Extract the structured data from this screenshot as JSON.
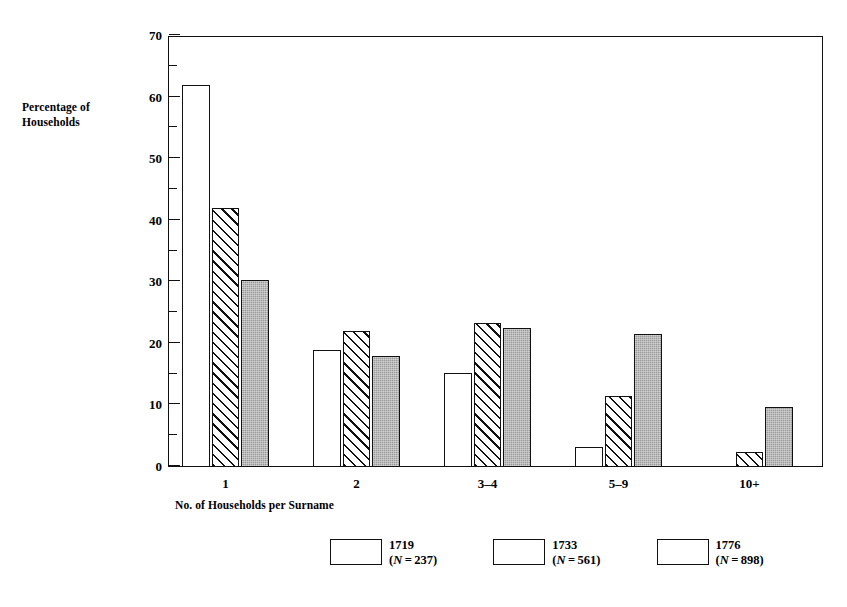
{
  "chart_data": {
    "type": "bar",
    "title": "",
    "xlabel": "No. of Households per Surname",
    "ylabel": "Percentage of Households",
    "categories": [
      "1",
      "2",
      "3–4",
      "5–9",
      "10+"
    ],
    "ylim": [
      0,
      70
    ],
    "y_ticks_major": [
      0,
      10,
      20,
      30,
      40,
      50,
      60,
      70
    ],
    "y_tick_labels": [
      "0",
      "10",
      "20",
      "30",
      "40",
      "50",
      "60",
      "70"
    ],
    "y_ticks_minor": [
      5,
      15,
      25,
      35,
      45,
      55,
      65
    ],
    "grid": false,
    "legend_position": "bottom-center",
    "series": [
      {
        "name": "1719",
        "n_label": "(N = 237)",
        "n_value": 237,
        "style": "open",
        "values": [
          62.0,
          19.0,
          15.3,
          3.2,
          0.0
        ]
      },
      {
        "name": "1733",
        "n_label": "(N = 561)",
        "n_value": 561,
        "style": "hatch",
        "values": [
          42.0,
          22.1,
          23.4,
          11.5,
          2.5
        ]
      },
      {
        "name": "1776",
        "n_label": "(N = 898)",
        "n_value": 898,
        "style": "solid",
        "values": [
          30.3,
          18.1,
          22.5,
          21.6,
          9.7
        ]
      }
    ]
  },
  "colors": {
    "axis": "#111111",
    "bar_open": "#ffffff",
    "bar_hatch": "#ffffff",
    "bar_solid": "#9a9a9a",
    "background": "#ffffff"
  }
}
